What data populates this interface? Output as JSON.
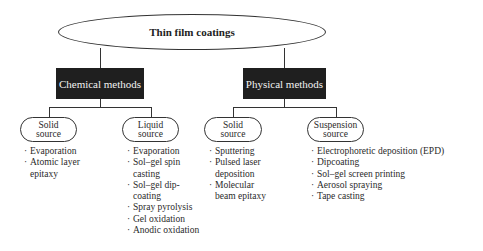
{
  "root": {
    "label": "Thin film coatings"
  },
  "methods": [
    {
      "label": "Chemical methods",
      "sources": [
        {
          "label_line1": "Solid",
          "label_line2": "source",
          "items": [
            "Evaporation",
            "Atomic layer epitaxy"
          ]
        },
        {
          "label_line1": "Liquid",
          "label_line2": "source",
          "items": [
            "Evaporation",
            "Sol–gel spin casting",
            "Sol–gel dip-coating",
            "Spray pyrolysis",
            "Gel oxidation",
            "Anodic oxidation"
          ]
        }
      ]
    },
    {
      "label": "Physical methods",
      "sources": [
        {
          "label_line1": "Solid",
          "label_line2": "source",
          "items": [
            "Sputtering",
            "Pulsed laser deposition",
            "Molecular beam epitaxy"
          ]
        },
        {
          "label_line1": "Suspension",
          "label_line2": "source",
          "items": [
            "Electrophoretic deposition (EPD)",
            "Dipcoating",
            "Sol–gel screen printing",
            "Aerosol spraying",
            "Tape casting"
          ]
        }
      ]
    }
  ],
  "colors": {
    "method_box_bg": "#1f1f1f",
    "method_box_text": "#f2f2f2",
    "line": "#333333"
  }
}
